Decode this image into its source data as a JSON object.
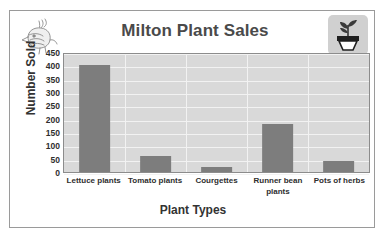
{
  "clipped_header_text": "",
  "decorations": {
    "top_left_icon": "bird-sketch-icon",
    "top_right_icon": "potted-plant-icon"
  },
  "colors": {
    "bar": "#7d7d7d",
    "plot_background": "#d9d9d9",
    "gridline": "#f2f2f2",
    "frame_border": "#9a9a9a",
    "title_text": "#4a4a4a",
    "axis_text": "#2e2e2e"
  },
  "chart_data": {
    "type": "bar",
    "title": "Milton Plant Sales",
    "xlabel": "Plant Types",
    "ylabel": "Number Sold",
    "categories": [
      "Lettuce plants",
      "Tomato plants",
      "Courgettes",
      "Runner bean plants",
      "Pots of herbs"
    ],
    "values": [
      400,
      60,
      20,
      180,
      40
    ],
    "ylim": [
      0,
      450
    ],
    "yticks": [
      0,
      50,
      100,
      150,
      200,
      250,
      300,
      350,
      400,
      450
    ],
    "ytick_labels": [
      "0",
      "50",
      "100",
      "150",
      "200",
      "250",
      "300",
      "350",
      "400",
      "450"
    ],
    "grid": true,
    "legend": "none"
  }
}
